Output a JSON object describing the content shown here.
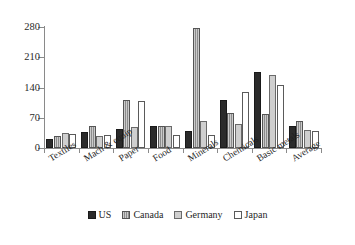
{
  "chart_data": {
    "type": "bar",
    "title": "",
    "subtitle": "",
    "xlabel": "",
    "ylabel": "",
    "ylim": [
      0,
      280
    ],
    "yticks": [
      0,
      70,
      140,
      210,
      280
    ],
    "grid": false,
    "legend_position": "bottom",
    "categories": [
      "Textiles",
      "Mach & equip",
      "Paper",
      "Food",
      "Minerals",
      "Chemicals",
      "Basic metals",
      "Average"
    ],
    "series": [
      {
        "name": "US",
        "color": "#2b2b2b",
        "values": [
          20,
          38,
          45,
          52,
          40,
          112,
          175,
          52
        ]
      },
      {
        "name": "Canada",
        "color": "#8c8c8c",
        "values": [
          28,
          52,
          110,
          52,
          278,
          82,
          78,
          62
        ]
      },
      {
        "name": "Germany",
        "color": "#cfcfcf",
        "values": [
          35,
          28,
          48,
          50,
          62,
          55,
          170,
          42
        ]
      },
      {
        "name": "Japan",
        "color": "#ffffff",
        "values": [
          33,
          30,
          108,
          30,
          30,
          130,
          145,
          40
        ]
      }
    ]
  }
}
